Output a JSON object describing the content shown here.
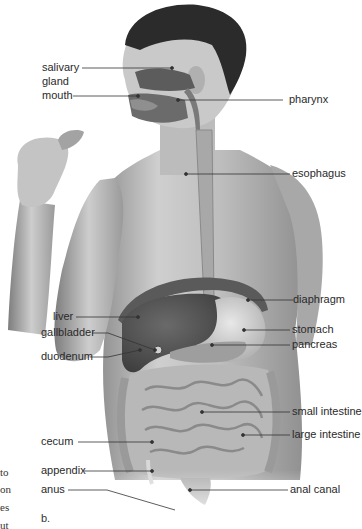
{
  "figure": {
    "panel_label": "b.",
    "left_margin_text_fragments": [
      "to",
      "on",
      "es",
      "ut"
    ],
    "labels": {
      "salivary_gland": "salivary\ngland",
      "salivary_line1": "salivary",
      "salivary_line2": "gland",
      "mouth": "mouth",
      "pharynx": "pharynx",
      "esophagus": "esophagus",
      "diaphragm": "diaphragm",
      "liver": "liver",
      "stomach": "stomach",
      "gallbladder": "gallbladder",
      "pancreas": "pancreas",
      "duodenum": "duodenum",
      "small_intestine": "small intestine",
      "large_intestine": "large intestine",
      "cecum": "cecum",
      "appendix": "appendix",
      "anus": "anus",
      "anal_canal": "anal canal"
    },
    "colors": {
      "background": "#ffffff",
      "skin_light": "#d9d9d9",
      "skin_mid": "#b5b5b5",
      "skin_dark": "#7a7a7a",
      "hair": "#2b2b2b",
      "organ_dark": "#4a4a4a",
      "label_text": "#2a2a2a",
      "leader_line": "#333333"
    }
  }
}
